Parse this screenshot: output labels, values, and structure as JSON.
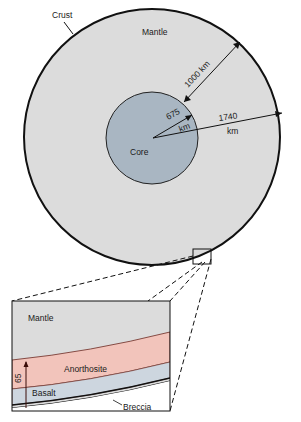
{
  "labels": {
    "crust": "Crust",
    "mantle": "Mantle",
    "core": "Core",
    "radius_1000": "1000 km",
    "core_radius_value": "675",
    "core_radius_unit": "km",
    "moon_radius_value": "1740",
    "moon_radius_unit": "km"
  },
  "inset": {
    "mantle": "Mantle",
    "anorthosite": "Anorthosite",
    "basalt": "Basalt",
    "breccia": "Breccia",
    "thickness": "65"
  },
  "colors": {
    "mantle": "#dcdcdc",
    "core": "#a9b6c2",
    "anorthosite": "#f2c4bb",
    "basalt": "#cdd6df",
    "outline": "#111111"
  }
}
